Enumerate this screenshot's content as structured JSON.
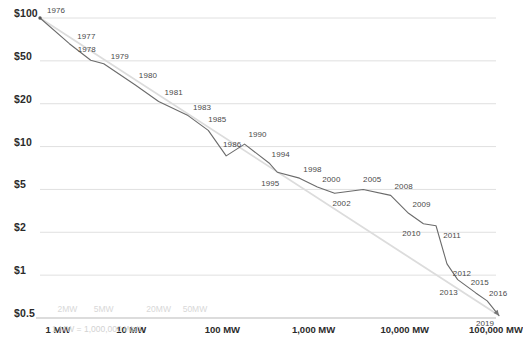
{
  "chart_data": {
    "type": "line",
    "title": "",
    "subtitle": "",
    "xlabel": "",
    "ylabel": "",
    "xscale": "log",
    "yscale": "log",
    "grid": true,
    "legend": "none",
    "xlim": [
      1,
      100000
    ],
    "ylim": [
      0.5,
      100
    ],
    "x_tick_labels": [
      "1 MW",
      "10 MW",
      "100 MW",
      "1,000 MW",
      "10,000 MW",
      "100,000 MW"
    ],
    "x_tick_values": [
      1,
      10,
      100,
      1000,
      10000,
      100000
    ],
    "x_minor_labels": [
      "2MW",
      "5MW",
      "20MW",
      "50MW"
    ],
    "x_minor_values": [
      2,
      5,
      20,
      50
    ],
    "y_tick_labels": [
      "$100",
      "$50",
      "$20",
      "$10",
      "$5",
      "$2",
      "$1",
      "$0.5"
    ],
    "y_tick_values": [
      100,
      50,
      20,
      10,
      5,
      2,
      1,
      0.5
    ],
    "footnote": "= 1,000,000 Watt",
    "series": [
      {
        "name": "price-experience-curve",
        "color": "#6b6b6b",
        "points": [
          {
            "label": "1976",
            "x": 1.0,
            "y": 100.0
          },
          {
            "label": "1977",
            "x": 2.1,
            "y": 66.0
          },
          {
            "label": "1978",
            "x": 3.6,
            "y": 50.5
          },
          {
            "label": "1979",
            "x": 5.0,
            "y": 47.0
          },
          {
            "label": "1980",
            "x": 11.0,
            "y": 30.0
          },
          {
            "label": "1981",
            "x": 20.0,
            "y": 21.0
          },
          {
            "label": "1983",
            "x": 42.0,
            "y": 16.5
          },
          {
            "label": "1985",
            "x": 70.0,
            "y": 13.0
          },
          {
            "label": "1986",
            "x": 110.0,
            "y": 8.6
          },
          {
            "label": "1990",
            "x": 175.0,
            "y": 10.4
          },
          {
            "label": "1994",
            "x": 330.0,
            "y": 7.6
          },
          {
            "label": "1995",
            "x": 400.0,
            "y": 6.6
          },
          {
            "label": "1998",
            "x": 700.0,
            "y": 6.0
          },
          {
            "label": "2000",
            "x": 1100.0,
            "y": 5.2
          },
          {
            "label": "2002",
            "x": 1700.0,
            "y": 4.6
          },
          {
            "label": "2005",
            "x": 3500.0,
            "y": 5.0
          },
          {
            "label": "2008",
            "x": 7000.0,
            "y": 4.4
          },
          {
            "label": "2009",
            "x": 11000.0,
            "y": 3.0
          },
          {
            "label": "2010",
            "x": 16000.0,
            "y": 2.4
          },
          {
            "label": "2011",
            "x": 22000.0,
            "y": 2.3
          },
          {
            "label": "2012",
            "x": 29000.0,
            "y": 1.2
          },
          {
            "label": "2013",
            "x": 38000.0,
            "y": 0.93
          },
          {
            "label": "2015",
            "x": 60000.0,
            "y": 0.75
          },
          {
            "label": "2016",
            "x": 80000.0,
            "y": 0.66
          },
          {
            "label": "2019",
            "x": 108000.0,
            "y": 0.52
          }
        ]
      },
      {
        "name": "learning-rate-trend-line",
        "color": "#dcdcdc",
        "points": [
          {
            "x": 1.0,
            "y": 100.0
          },
          {
            "x": 108000.0,
            "y": 0.52
          }
        ]
      }
    ]
  },
  "labels": {
    "footnote_prefix": "1 MW"
  }
}
